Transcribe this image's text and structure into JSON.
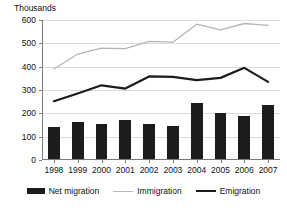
{
  "chart_data": {
    "type": "bar",
    "title": "",
    "subtitle": "",
    "unit_label": "Thousands",
    "xlabel": "",
    "ylabel": "",
    "ylim": [
      0,
      600
    ],
    "ytick_values": [
      0,
      100,
      200,
      300,
      400,
      500,
      600
    ],
    "ytick_labels": [
      "0",
      "100",
      "200",
      "300",
      "400",
      "500",
      "600"
    ],
    "grid": true,
    "legend_position": "bottom",
    "categories": [
      "1998",
      "1999",
      "2000",
      "2001",
      "2002",
      "2003",
      "2004",
      "2005",
      "2006",
      "2007"
    ],
    "series": [
      {
        "name": "Net migration",
        "type": "bar",
        "color": "#1c1c1c",
        "values": [
          141,
          164,
          156,
          172,
          153,
          145,
          243,
          203,
          190,
          235
        ]
      },
      {
        "name": "Immigration",
        "type": "line",
        "color": "#b6b6b6",
        "values": [
          390,
          454,
          479,
          477,
          508,
          505,
          582,
          558,
          585,
          577
        ]
      },
      {
        "name": "Emigration",
        "type": "line",
        "color": "#1c1c1c",
        "values": [
          252,
          285,
          320,
          306,
          358,
          356,
          342,
          352,
          395,
          335
        ]
      }
    ]
  },
  "legend": {
    "items": [
      {
        "label": "Net migration",
        "marker": "bar-swatch",
        "color": "#1c1c1c"
      },
      {
        "label": "Immigration",
        "marker": "line-swatch",
        "color": "#b6b6b6"
      },
      {
        "label": "Emigration",
        "marker": "line-swatch",
        "color": "#1c1c1c"
      }
    ]
  }
}
